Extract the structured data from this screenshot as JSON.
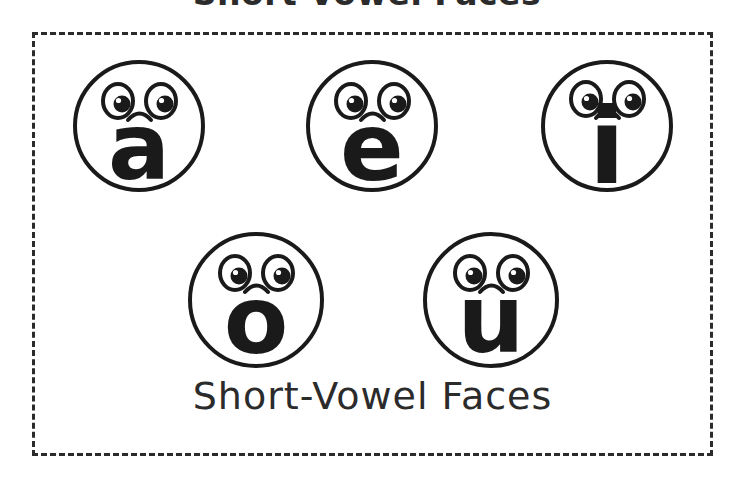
{
  "page": {
    "title": "Short-Vowel Faces",
    "caption": "Short-Vowel Faces",
    "background_color": "#ffffff",
    "ink_color": "#1a1a1a",
    "border_style": "dashed",
    "border_color": "#2b2b2b"
  },
  "diagram": {
    "type": "worksheet",
    "rows": [
      {
        "row_index": 0,
        "count": 3
      },
      {
        "row_index": 1,
        "count": 2
      }
    ],
    "face_parts": {
      "outline": "circle-outline",
      "left_eye": "eye-oval-with-pupil",
      "right_eye": "eye-oval-with-pupil",
      "mouth": "small-downward-arc"
    },
    "faces": [
      {
        "id": "face-a",
        "letter": "a",
        "row": 0,
        "column": 0,
        "letter_name": "short-a"
      },
      {
        "id": "face-e",
        "letter": "e",
        "row": 0,
        "column": 1,
        "letter_name": "short-e"
      },
      {
        "id": "face-i",
        "letter": "i",
        "row": 0,
        "column": 2,
        "letter_name": "short-i"
      },
      {
        "id": "face-o",
        "letter": "o",
        "row": 1,
        "column": 0,
        "letter_name": "short-o"
      },
      {
        "id": "face-u",
        "letter": "u",
        "row": 1,
        "column": 1,
        "letter_name": "short-u"
      }
    ]
  }
}
